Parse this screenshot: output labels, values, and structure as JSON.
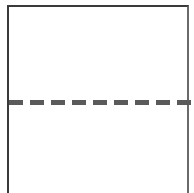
{
  "diagram": {
    "shape": "open-bottom-rectangle",
    "border_color": "#3a3a3a",
    "divider": {
      "style": "dashed",
      "color": "#5a5a5a",
      "dash_count": 9,
      "position_y_px": 100
    }
  }
}
